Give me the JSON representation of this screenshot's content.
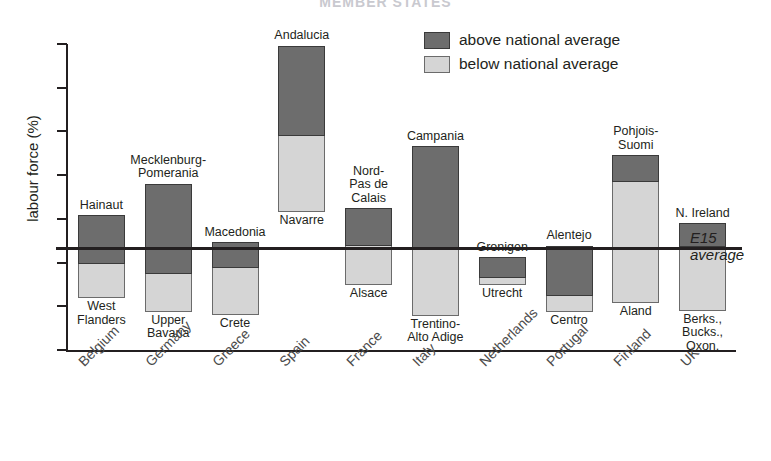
{
  "title": "MEMBER STATES",
  "legend": {
    "position": "top-right",
    "items": [
      {
        "key": "above",
        "label": "above national average",
        "color": "#6d6d6d"
      },
      {
        "key": "below",
        "label": "below national average",
        "color": "#d5d5d5"
      }
    ]
  },
  "axes": {
    "ylabel": "labour force (%)",
    "yticks": [
      "0",
      "5",
      "10",
      "15",
      "20",
      "25",
      "30",
      "35"
    ],
    "ymin": 0,
    "ymax": 35,
    "xlabel": ""
  },
  "reference_line": {
    "label_line1": "E15",
    "label_line2": "average",
    "value": 11.7
  },
  "chart_data": {
    "type": "bar",
    "title": "MEMBER STATES",
    "xlabel": "",
    "ylabel": "labour force (%)",
    "ylim": [
      0,
      35
    ],
    "yticks": [
      0,
      5,
      10,
      15,
      20,
      25,
      30,
      35
    ],
    "grid": false,
    "legend_position": "top-right",
    "orientation": "vertical",
    "note": "Each bar is a floating range from the lowest-unemployment region to the highest-unemployment region of the member state; the segment above the national average is dark, the segment below is light. The horizontal line marks the E15 average of 11.7%.",
    "reference_lines": [
      {
        "name": "E15 average",
        "value": 11.7,
        "orientation": "horizontal"
      }
    ],
    "categories": [
      "Belgium",
      "Germany",
      "Greece",
      "Spain",
      "France",
      "Italy",
      "Netherlands",
      "Portugal",
      "Finland",
      "UK"
    ],
    "series": [
      {
        "name": "above national average",
        "color": "#6d6d6d",
        "values": [
          15.4,
          19.0,
          12.3,
          34.8,
          16.2,
          23.3,
          10.6,
          11.9,
          22.3,
          14.5
        ]
      },
      {
        "name": "national average (segment boundary)",
        "color": "#000000",
        "values": [
          9.8,
          8.7,
          9.4,
          24.5,
          11.9,
          11.4,
          8.2,
          6.2,
          19.2,
          11.8
        ]
      },
      {
        "name": "below national average",
        "color": "#d5d5d5",
        "values": [
          5.9,
          4.4,
          4.0,
          15.8,
          7.4,
          3.9,
          7.4,
          4.3,
          5.4,
          4.5
        ]
      }
    ],
    "points": [
      {
        "country": "Belgium",
        "high_region": "Hainaut",
        "high_value": 15.4,
        "national_average": 9.8,
        "low_region": "West\nFlanders",
        "low_value": 5.9
      },
      {
        "country": "Germany",
        "high_region": "Mecklenburg-\nPomerania",
        "high_value": 19.0,
        "national_average": 8.7,
        "low_region": "Upper\nBavaria",
        "low_value": 4.4
      },
      {
        "country": "Greece",
        "high_region": "Macedonia",
        "high_value": 12.3,
        "national_average": 9.4,
        "low_region": "Crete",
        "low_value": 4.0
      },
      {
        "country": "Spain",
        "high_region": "Andalucia",
        "high_value": 34.8,
        "national_average": 24.5,
        "low_region": "Navarre",
        "low_value": 15.8
      },
      {
        "country": "France",
        "high_region": "Nord-\nPas de\nCalais",
        "high_value": 16.2,
        "national_average": 11.9,
        "low_region": "Alsace",
        "low_value": 7.4
      },
      {
        "country": "Italy",
        "high_region": "Campania",
        "high_value": 23.3,
        "national_average": 11.4,
        "low_region": "Trentino-\nAlto Adige",
        "low_value": 3.9
      },
      {
        "country": "Netherlands",
        "high_region": "Gronigen",
        "high_value": 10.6,
        "national_average": 8.2,
        "low_region": "Utrecht",
        "low_value": 7.4
      },
      {
        "country": "Portugal",
        "high_region": "Alentejo",
        "high_value": 11.9,
        "national_average": 6.2,
        "low_region": "Centro",
        "low_value": 4.3
      },
      {
        "country": "Finland",
        "high_region": "Pohjois-\nSuomi",
        "high_value": 22.3,
        "national_average": 19.2,
        "low_region": "Aland",
        "low_value": 5.4
      },
      {
        "country": "UK",
        "high_region": "N. Ireland",
        "high_value": 14.5,
        "national_average": 11.8,
        "low_region": "Berks.,\nBucks.,\nOxon.",
        "low_value": 4.5
      }
    ]
  },
  "colors": {
    "above": "#6d6d6d",
    "below": "#d5d5d5",
    "axis": "#231f20",
    "background": "#ffffff"
  }
}
